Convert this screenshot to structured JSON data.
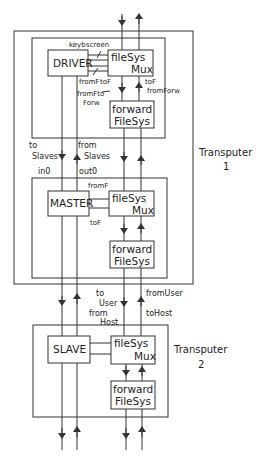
{
  "diagram": {
    "transputer1": {
      "label": "Transputer",
      "number": "1",
      "driver_block": {
        "driver": "DRIVER",
        "mux_line1": "fileSys",
        "mux_line2": "Mux",
        "forward_line1": "forward",
        "forward_line2": "FileSys",
        "channels": {
          "keyb": "keyb",
          "screen": "screen",
          "fromF": "fromF",
          "toF": "toF",
          "fromFtoForw_1": "fromFto",
          "fromFtoForw_2": "Forw",
          "toF_right": "toF",
          "fromForw": "fromForw"
        }
      },
      "master_block": {
        "master": "MASTER",
        "mux_line1": "fileSys",
        "mux_line2": "Mux",
        "forward_line1": "forward",
        "forward_line2": "FileSys",
        "channels": {
          "fromF": "fromF",
          "toF": "toF"
        }
      },
      "between_labels": {
        "toSlaves_1": "to",
        "toSlaves_2": "Slaves",
        "fromSlaves_1": "from",
        "fromSlaves_2": "Slaves",
        "in0": "in0",
        "out0": "out0"
      }
    },
    "links": {
      "toUser_1": "to",
      "toUser_2": "User",
      "fromHost_1": "from",
      "fromHost_2": "Host",
      "fromUser": "fromUser",
      "toHost": "toHost"
    },
    "transputer2": {
      "label": "Transputer",
      "number": "2",
      "slave": "SLAVE",
      "mux_line1": "fileSys",
      "mux_line2": "Mux",
      "forward_line1": "forward",
      "forward_line2": "FileSys"
    }
  }
}
